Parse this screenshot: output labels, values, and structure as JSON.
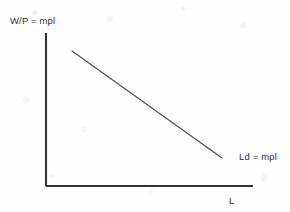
{
  "figure": {
    "background_color": "#fefefe",
    "axis_color": "#333333",
    "curve_color": "#4a4a4a",
    "text_color": "#2e2e2e"
  },
  "labels": {
    "y_axis": "W/P = mpl",
    "x_axis": "L",
    "curve": "Ld = mpl"
  },
  "chart_data": {
    "type": "line",
    "title": "",
    "subtitle": "",
    "xlabel": "L",
    "ylabel": "W/P = mpl",
    "xlim": [
      0,
      1
    ],
    "ylim": [
      0,
      1
    ],
    "grid": false,
    "legend": "inline-right-of-curve-endpoint",
    "axis_ticks": {
      "x": [],
      "y": []
    },
    "annotations": [
      {
        "text": "Ld = mpl",
        "x": 0.94,
        "y": 0.2
      },
      {
        "text": "W/P = mpl",
        "x": 0.0,
        "y": 1.06
      },
      {
        "text": "L",
        "x": 0.89,
        "y": -0.09
      }
    ],
    "series": [
      {
        "name": "Ld = mpl",
        "label": "Ld = mpl",
        "description": "Downward-sloping labor demand curve equal to the marginal product of labor",
        "color": "#4a4a4a",
        "x": [
          0.126,
          0.851
        ],
        "y": [
          0.882,
          0.183
        ],
        "points": [
          {
            "x": 0.126,
            "y": 0.882
          },
          {
            "x": 0.851,
            "y": 0.183
          }
        ],
        "slope": "negative",
        "linestyle": "solid"
      }
    ]
  },
  "geometry": {
    "y_axis": {
      "x1": 46,
      "y1": 33,
      "x2": 46,
      "y2": 186
    },
    "x_axis": {
      "x1": 46,
      "y1": 186,
      "x2": 253,
      "y2": 186
    },
    "curve": {
      "x1": 72,
      "y1": 51,
      "x2": 222,
      "y2": 158
    }
  }
}
